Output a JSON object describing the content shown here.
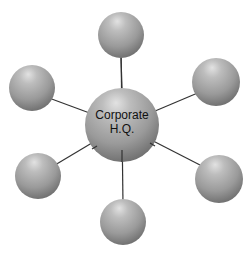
{
  "diagram": {
    "type": "hub-and-spoke",
    "hub": {
      "label_line1": "Corporate",
      "label_line2": "H.Q.",
      "cx": 122,
      "cy": 125,
      "r": 37
    },
    "satellites": [
      {
        "id": "top",
        "cx": 121,
        "cy": 35,
        "r": 23
      },
      {
        "id": "upper-left",
        "cx": 32,
        "cy": 88,
        "r": 23
      },
      {
        "id": "upper-right",
        "cx": 216,
        "cy": 82,
        "r": 24
      },
      {
        "id": "lower-left",
        "cx": 38,
        "cy": 176,
        "r": 23
      },
      {
        "id": "lower-right",
        "cx": 219,
        "cy": 179,
        "r": 24
      },
      {
        "id": "bottom",
        "cx": 123,
        "cy": 222,
        "r": 23
      }
    ],
    "colors": {
      "sphere_highlight": "#d8d8d8",
      "sphere_mid": "#a6a6a6",
      "sphere_edge": "#6e6e6e",
      "connector": "#333333",
      "label": "#111111",
      "background": "#ffffff"
    }
  }
}
